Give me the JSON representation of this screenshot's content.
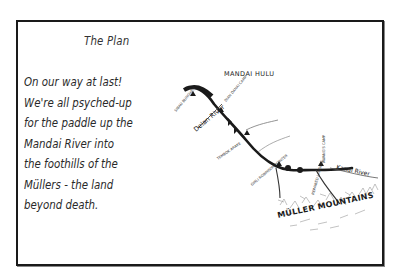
{
  "card": {
    "title": "The Plan",
    "body_lines": [
      "On our way at last!",
      "We're all psyched-up",
      "for the paddle up the",
      "Mandai River into",
      "the foothills of the",
      "Müllers - the land",
      "beyond death."
    ]
  },
  "map": {
    "region_label": "MANDAI HULU",
    "mountains_label": "MÜLLER MOUNTAINS",
    "rivers": [
      {
        "name": "Delan River"
      },
      {
        "name": "Kanal River"
      }
    ],
    "camps": [
      {
        "name": "SIBAU BUNGHEN"
      },
      {
        "name": "DIAN DANAI CAMP"
      },
      {
        "name": "TEMBOK ARAKE"
      },
      {
        "name": "GIRLI ROBINSON POINTER"
      },
      {
        "name": "AWANG'S CAMP"
      },
      {
        "name": "REPAIRED LANDING"
      }
    ],
    "colors": {
      "ink": "#1a1a1a",
      "sketch": "#777777"
    }
  }
}
